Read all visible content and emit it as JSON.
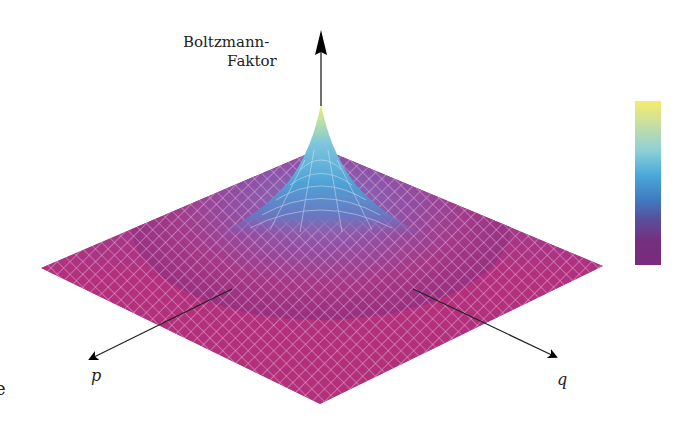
{
  "figure": {
    "type": "3d-surface",
    "axes": {
      "vertical_label_line1": "Boltzmann-",
      "vertical_label_line2": "Faktor",
      "p_label": "p",
      "q_label": "q"
    },
    "edge_fragment": "e",
    "colors": {
      "low": "#8e2a7e",
      "low_mid": "#c2347a",
      "mid": "#6a5fb0",
      "high_mid": "#4fa8d8",
      "high": "#f2ec6a",
      "grid_line": "#f0c8e8",
      "arrow": "#000000"
    },
    "colorbar": {
      "stops": [
        "#f5ec6a",
        "#cfe09a",
        "#8fd0d6",
        "#4aa9da",
        "#3f7cc0",
        "#5a4f9c",
        "#74307f",
        "#7a2a7c"
      ]
    }
  }
}
